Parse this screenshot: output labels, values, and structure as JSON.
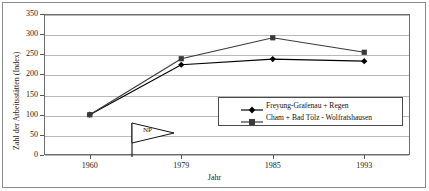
{
  "chart_data": {
    "type": "line",
    "title": "",
    "xlabel": "Jahr",
    "ylabel": "Zahl der Arbeitsstätten (Index)",
    "categories": [
      "1960",
      "1979",
      "1985",
      "1993"
    ],
    "ylim": [
      0,
      350
    ],
    "yticks": [
      0,
      50,
      100,
      150,
      200,
      250,
      300,
      350
    ],
    "ytick_labels": [
      "0",
      "50",
      "100",
      "150",
      "200",
      "250",
      "300",
      "350"
    ],
    "grid": "horizontal",
    "legend_position": "inside-lower-right",
    "series": [
      {
        "name": "Freyung-Grafenau + Regen",
        "marker": "diamond",
        "color": "#000000",
        "values": [
          100,
          224,
          238,
          233
        ]
      },
      {
        "name": "Cham + Bad Tölz - Wolfratshausen",
        "marker": "square",
        "color": "#3a3a3a",
        "values": [
          100,
          239,
          291,
          255
        ]
      }
    ],
    "annotations": [
      {
        "label": "NP",
        "shape": "pennant-flag",
        "x_position_between": [
          "1960",
          "1979"
        ]
      }
    ]
  },
  "legend": {
    "entries": [
      {
        "label": "Freyung-Grafenau + Regen"
      },
      {
        "label": "Cham + Bad Tölz - Wolfratshausen"
      }
    ]
  }
}
